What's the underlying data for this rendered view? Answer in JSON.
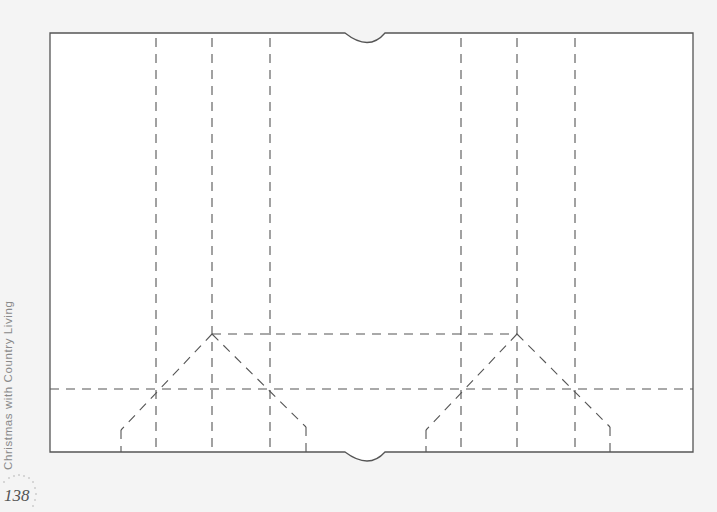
{
  "page": {
    "side_title": "Christmas with Country Living",
    "page_number": "138"
  },
  "template": {
    "outline_color": "#555555",
    "fold_line_color": "#555555",
    "paper_color": "#ffffff",
    "background_color": "#f4f4f4"
  }
}
